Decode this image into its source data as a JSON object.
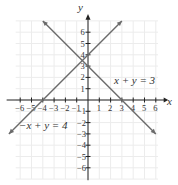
{
  "chart_data": {
    "type": "line",
    "title": "",
    "xlabel": "x",
    "ylabel": "y",
    "xlim": [
      -6,
      6
    ],
    "ylim": [
      -6,
      6
    ],
    "grid": true,
    "x_ticks": [
      -6,
      -5,
      -4,
      -3,
      -2,
      -1,
      1,
      2,
      3,
      4,
      5,
      6
    ],
    "y_ticks": [
      6,
      5,
      4,
      3,
      2,
      1,
      -1,
      -2,
      -3,
      -4,
      -5,
      -6
    ],
    "x_tick_labels": [
      "-6",
      "-5",
      "-4",
      "-3",
      "-2",
      "-1",
      "1",
      "2",
      "3",
      "4",
      "5",
      "6"
    ],
    "y_tick_labels": [
      "6",
      "5",
      "4",
      "3",
      "2",
      "1",
      "-1",
      "-2",
      "-3",
      "-4",
      "-5",
      "-6"
    ],
    "series": [
      {
        "name": "x + y = 3",
        "equation": "x + y = 3",
        "points": [
          [
            -4,
            7
          ],
          [
            6,
            -3
          ]
        ],
        "x_intercept": 3,
        "y_intercept": 3,
        "color": "#6b6b6b"
      },
      {
        "name": "-x + y = 4",
        "equation": "-x + y = 4",
        "points": [
          [
            -7,
            -3
          ],
          [
            3,
            7
          ]
        ],
        "x_intercept": -4,
        "y_intercept": 4,
        "color": "#6b6b6b"
      }
    ],
    "intersection": [
      -0.5,
      3.5
    ],
    "annotations": [
      {
        "text": "x + y = 3",
        "near": [
          3.5,
          3
        ]
      },
      {
        "text": "−x + y = 4",
        "near": [
          -4,
          -2.5
        ]
      }
    ]
  },
  "labels": {
    "x_axis": "x",
    "y_axis": "y",
    "eq1": "x + y = 3",
    "eq2": "−x + y = 4"
  }
}
